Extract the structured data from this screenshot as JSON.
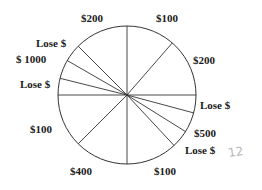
{
  "wheel": {
    "center": [
      127,
      95
    ],
    "radius": 69,
    "stroke_color": "#333333",
    "spoke_angles_deg": [
      90,
      49,
      0,
      -15,
      -32,
      -47,
      -90,
      -135,
      180,
      166,
      150,
      135
    ]
  },
  "labels": [
    {
      "text": "$200",
      "x": 81,
      "y": 13
    },
    {
      "text": "$100",
      "x": 156,
      "y": 13
    },
    {
      "text": "Lose $",
      "x": 36,
      "y": 38
    },
    {
      "text": "$ 1000",
      "x": 16,
      "y": 54
    },
    {
      "text": "$200",
      "x": 193,
      "y": 55
    },
    {
      "text": "Lose $",
      "x": 20,
      "y": 79
    },
    {
      "text": "Lose $",
      "x": 200,
      "y": 100
    },
    {
      "text": "$100",
      "x": 30,
      "y": 124
    },
    {
      "text": "$500",
      "x": 194,
      "y": 128
    },
    {
      "text": "Lose $",
      "x": 185,
      "y": 145
    },
    {
      "text": "$400",
      "x": 70,
      "y": 166
    },
    {
      "text": "$100",
      "x": 154,
      "y": 166
    }
  ],
  "annotation": {
    "text": "12",
    "x": 228,
    "y": 145
  }
}
